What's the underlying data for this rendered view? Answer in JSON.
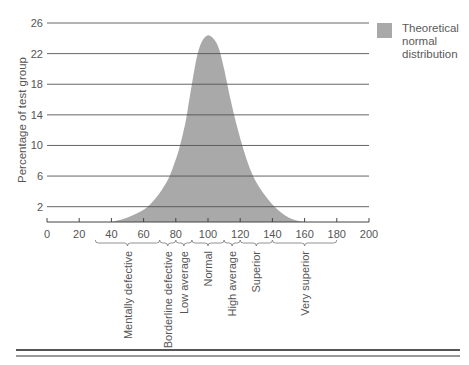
{
  "chart_data": {
    "type": "area",
    "title": "",
    "xlabel": "",
    "ylabel": "Percentage of test group",
    "xlim": [
      0,
      200
    ],
    "ylim": [
      0,
      26
    ],
    "x_ticks": [
      0,
      20,
      40,
      60,
      80,
      100,
      120,
      140,
      160,
      180,
      200
    ],
    "y_ticks": [
      2,
      6,
      10,
      14,
      18,
      22,
      26
    ],
    "grid": "horizontal",
    "legend_position": "top-right",
    "series": [
      {
        "name": "Theoretical normal distribution",
        "color": "#a9a9a9",
        "x": [
          40,
          50,
          60,
          65,
          70,
          75,
          78,
          82,
          86,
          88,
          90,
          93,
          96,
          100,
          104,
          107,
          110,
          112,
          114,
          118,
          122,
          126,
          130,
          135,
          140,
          145,
          150,
          155,
          160
        ],
        "values": [
          0,
          0.6,
          1.6,
          2.5,
          3.8,
          5.5,
          7,
          9.5,
          13,
          15.5,
          18,
          21.5,
          23.5,
          24.4,
          23.8,
          22.5,
          20,
          18,
          16,
          12.5,
          9.5,
          7,
          5.2,
          3.6,
          2.3,
          1.3,
          0.6,
          0.2,
          0
        ]
      }
    ],
    "classifications": [
      {
        "label": "Mentally defective",
        "from": 30,
        "to": 70
      },
      {
        "label": "Borderline defective",
        "from": 70,
        "to": 80
      },
      {
        "label": "Low average",
        "from": 80,
        "to": 90
      },
      {
        "label": "Normal",
        "from": 90,
        "to": 110
      },
      {
        "label": "High average",
        "from": 110,
        "to": 120
      },
      {
        "label": "Superior",
        "from": 120,
        "to": 140
      },
      {
        "label": "Very superior",
        "from": 140,
        "to": 180
      }
    ]
  },
  "legend": {
    "label": "Theoretical\nnormal\ndistribution",
    "color": "#a9a9a9"
  },
  "axis": {
    "ylabel": "Percentage of test group"
  }
}
